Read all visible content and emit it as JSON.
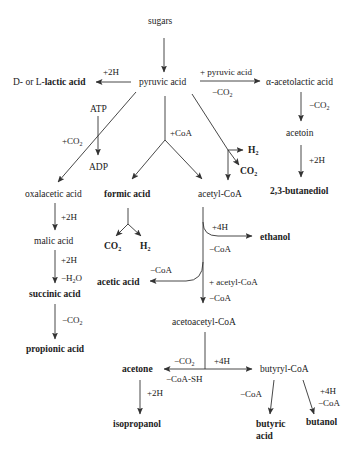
{
  "diagram": {
    "nodes": {
      "sugars": "sugars",
      "pyruvic_acid": "pyruvic acid",
      "lactic_prefix": "D- or L-",
      "lactic": "lactic acid",
      "acetolactic": "α-acetolactic acid",
      "acetoin": "acetoin",
      "butanediol": "2,3-butanediol",
      "atp": "ATP",
      "adp": "ADP",
      "oxalacetic": "oxalacetic acid",
      "malic": "malic acid",
      "succinic": "succinic acid",
      "propionic": "propionic acid",
      "formic": "formic acid",
      "formic_co2": "CO",
      "formic_h2": "H",
      "acetyl_coa": "acetyl-CoA",
      "h2_direct": "H",
      "co2_direct": "CO",
      "ethanol": "ethanol",
      "acetic": "acetic acid",
      "acetoacetyl": "acetoacetyl-CoA",
      "acetone": "acetone",
      "isopropanol": "isopropanol",
      "butyryl": "butyryl-CoA",
      "butyric_1": "butyric",
      "butyric_2": "acid",
      "butanol": "butanol"
    },
    "labels": {
      "to_lactic": "+2H",
      "to_acetolactic_top": "+ pyruvic acid",
      "to_acetolactic_bottom": "−CO",
      "acetolactic_to_acetoin": "−CO",
      "acetoin_to_butanediol": "+2H",
      "to_oxalacetic": "+CO",
      "to_formic": "+CoA",
      "oxalacetic_to_malic": "+2H",
      "malic_to_succinic_1": "+2H",
      "malic_to_succinic_2": "−H",
      "malic_to_succinic_2b": "O",
      "succinic_to_propionic": "−CO",
      "to_ethanol_1": "+4H",
      "to_ethanol_2": "−CoA",
      "to_acetic": "−CoA",
      "to_acetoacetyl_1": "+ acetyl-CoA",
      "to_acetoacetyl_2": "−CoA",
      "to_acetone_1": "−CO",
      "to_acetone_2": "−CoA-SH",
      "to_butyryl": "+4H",
      "acetone_to_isopropanol": "+2H",
      "butyryl_to_butyric": "−CoA",
      "butyryl_to_butanol_1": "+4H",
      "butyryl_to_butanol_2": "−CoA"
    },
    "subscript_2": "2"
  }
}
